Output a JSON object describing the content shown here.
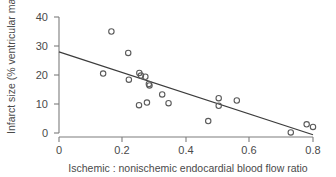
{
  "chart_data": {
    "type": "scatter",
    "title": "",
    "subtitle": "",
    "xlabel": "Ischemic : nonischemic endocardial blood flow ratio",
    "ylabel": "Infarct size (% ventricular mass)",
    "xlim": [
      0,
      0.8
    ],
    "ylim": [
      0,
      40
    ],
    "xticks": [
      0,
      0.2,
      0.4,
      0.6,
      0.8
    ],
    "xtick_labels": [
      "0",
      "0.2",
      "0.4",
      "0.6",
      "0.8"
    ],
    "yticks": [
      0,
      10,
      20,
      30,
      40
    ],
    "ytick_labels": [
      "0",
      "10",
      "20",
      "30",
      "40"
    ],
    "grid": false,
    "legend": null,
    "marker": "open-circle",
    "series": [
      {
        "name": "Infarct size vs flow ratio",
        "points": [
          [
            0.165,
            35.0
          ],
          [
            0.218,
            27.6
          ],
          [
            0.139,
            20.5
          ],
          [
            0.253,
            20.7
          ],
          [
            0.258,
            19.8
          ],
          [
            0.272,
            19.4
          ],
          [
            0.22,
            18.4
          ],
          [
            0.283,
            16.9
          ],
          [
            0.285,
            16.4
          ],
          [
            0.325,
            13.3
          ],
          [
            0.503,
            12.0
          ],
          [
            0.56,
            11.2
          ],
          [
            0.345,
            10.3
          ],
          [
            0.277,
            10.5
          ],
          [
            0.252,
            9.6
          ],
          [
            0.503,
            9.4
          ],
          [
            0.47,
            4.1
          ],
          [
            0.78,
            3.0
          ],
          [
            0.8,
            2.1
          ],
          [
            0.73,
            0.2
          ]
        ]
      }
    ],
    "fit_line": {
      "name": "linear regression",
      "x_start": 0.0,
      "y_start": 28.0,
      "x_end": 0.8,
      "y_end": -0.6
    }
  }
}
